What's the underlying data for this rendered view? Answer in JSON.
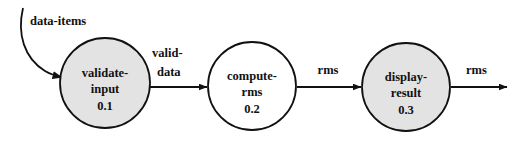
{
  "diagram": {
    "type": "data-flow-diagram",
    "background_color": "#ffffff",
    "stroke_color": "#111111",
    "processes": [
      {
        "id": "validate-input",
        "name_line1": "validate-",
        "name_line2": "input",
        "number": "0.1",
        "fill_color": "#e3e3e3",
        "cx": 105,
        "cy": 83,
        "r": 45
      },
      {
        "id": "compute-rms",
        "name_line1": "compute-",
        "name_line2": "rms",
        "number": "0.2",
        "fill_color": "#ffffff",
        "cx": 252,
        "cy": 86,
        "r": 44
      },
      {
        "id": "display-result",
        "name_line1": "display-",
        "name_line2": "result",
        "number": "0.3",
        "fill_color": "#e3e3e3",
        "cx": 406,
        "cy": 87,
        "r": 44
      }
    ],
    "flows": [
      {
        "id": "data-items",
        "label": "data-items",
        "shape": "curved",
        "target": "validate-input"
      },
      {
        "id": "valid-data",
        "label_line1": "valid-",
        "label_line2": "data",
        "shape": "straight",
        "source": "validate-input",
        "target": "compute-rms"
      },
      {
        "id": "rms-1",
        "label": "rms",
        "shape": "straight",
        "source": "compute-rms",
        "target": "display-result"
      },
      {
        "id": "rms-2",
        "label": "rms",
        "shape": "straight",
        "source": "display-result",
        "target": "external"
      }
    ]
  }
}
